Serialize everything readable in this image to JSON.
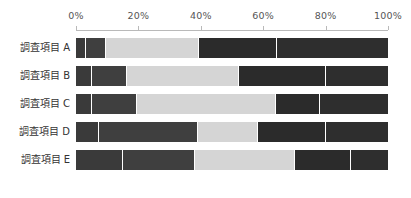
{
  "chart_data": {
    "type": "bar",
    "subtype": "stacked-horizontal-100",
    "title": "",
    "xlabel": "",
    "ylabel": "",
    "categories": [
      "調査項目 A",
      "調査項目 B",
      "調査項目 C",
      "調査項目 D",
      "調査項目 E"
    ],
    "xlim": [
      0,
      100
    ],
    "xticks": [
      0,
      20,
      40,
      60,
      80,
      100
    ],
    "xtick_labels": [
      "0%",
      "20%",
      "40%",
      "60%",
      "80%",
      "100%"
    ],
    "grid": false,
    "legend": "none",
    "series": [
      {
        "name": "Segment 1",
        "color": "#3a3a3a",
        "values": [
          3,
          5,
          5,
          7,
          15
        ]
      },
      {
        "name": "Segment 2",
        "color": "#3f3f3f",
        "values": [
          6,
          11,
          14,
          32,
          23
        ]
      },
      {
        "name": "Segment 3",
        "color": "#d5d5d5",
        "values": [
          30,
          36,
          45,
          19,
          32
        ]
      },
      {
        "name": "Segment 4",
        "color": "#2b2b2b",
        "values": [
          25,
          28,
          14,
          22,
          18
        ]
      },
      {
        "name": "Segment 5",
        "color": "#2e2e2e",
        "values": [
          36,
          20,
          22,
          20,
          12
        ]
      }
    ],
    "rows": [
      {
        "label": "調査項目 A",
        "segments": [
          {
            "value": 3,
            "color": "#3a3a3a"
          },
          {
            "value": 6,
            "color": "#3f3f3f"
          },
          {
            "value": 30,
            "color": "#d5d5d5"
          },
          {
            "value": 25,
            "color": "#2b2b2b"
          },
          {
            "value": 36,
            "color": "#2e2e2e"
          }
        ]
      },
      {
        "label": "調査項目 B",
        "segments": [
          {
            "value": 5,
            "color": "#3a3a3a"
          },
          {
            "value": 11,
            "color": "#3f3f3f"
          },
          {
            "value": 36,
            "color": "#d5d5d5"
          },
          {
            "value": 28,
            "color": "#2b2b2b"
          },
          {
            "value": 20,
            "color": "#2e2e2e"
          }
        ]
      },
      {
        "label": "調査項目 C",
        "segments": [
          {
            "value": 5,
            "color": "#3a3a3a"
          },
          {
            "value": 14,
            "color": "#3f3f3f"
          },
          {
            "value": 45,
            "color": "#d5d5d5"
          },
          {
            "value": 14,
            "color": "#2b2b2b"
          },
          {
            "value": 22,
            "color": "#2e2e2e"
          }
        ]
      },
      {
        "label": "調査項目 D",
        "segments": [
          {
            "value": 7,
            "color": "#3a3a3a"
          },
          {
            "value": 32,
            "color": "#3f3f3f"
          },
          {
            "value": 19,
            "color": "#d5d5d5"
          },
          {
            "value": 22,
            "color": "#2b2b2b"
          },
          {
            "value": 20,
            "color": "#2e2e2e"
          }
        ]
      },
      {
        "label": "調査項目 E",
        "segments": [
          {
            "value": 15,
            "color": "#3a3a3a"
          },
          {
            "value": 23,
            "color": "#3f3f3f"
          },
          {
            "value": 32,
            "color": "#d5d5d5"
          },
          {
            "value": 18,
            "color": "#2b2b2b"
          },
          {
            "value": 12,
            "color": "#2e2e2e"
          }
        ]
      }
    ],
    "colors": {
      "axis": "#b9b9b9",
      "tick_text": "#555555",
      "label_text": "#333333",
      "background": "#ffffff",
      "segment_gap": "#ffffff"
    }
  }
}
